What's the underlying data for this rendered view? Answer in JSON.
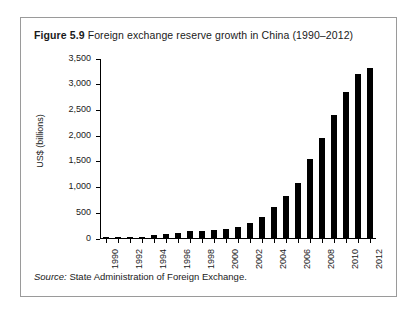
{
  "figure": {
    "label": "Figure 5.9",
    "title": "Foreign exchange reserve growth in China (1990–2012)",
    "source_label": "Source:",
    "source_text": "State Administration of Foreign Exchange."
  },
  "chart_data": {
    "type": "bar",
    "title": "Foreign exchange reserve growth in China (1990–2012)",
    "xlabel": "",
    "ylabel": "US$ (billions)",
    "ylim": [
      0,
      3500
    ],
    "ytick_labels": [
      "0",
      "500",
      "1,000",
      "1,500",
      "2,000",
      "2,500",
      "3,000",
      "3,500"
    ],
    "ytick_values": [
      0,
      500,
      1000,
      1500,
      2000,
      2500,
      3000,
      3500
    ],
    "grid": false,
    "legend": "none",
    "bar_color": "#000000",
    "categories": [
      "1990",
      "1991",
      "1992",
      "1993",
      "1994",
      "1995",
      "1996",
      "1997",
      "1998",
      "1999",
      "2000",
      "2001",
      "2002",
      "2003",
      "2004",
      "2005",
      "2006",
      "2007",
      "2008",
      "2009",
      "2010",
      "2011",
      "2012"
    ],
    "xtick_labels_shown": [
      "1990",
      "1992",
      "1994",
      "1996",
      "1998",
      "2000",
      "2002",
      "2004",
      "2006",
      "2008",
      "2010",
      "2012"
    ],
    "values": [
      11,
      22,
      19,
      21,
      52,
      74,
      107,
      140,
      145,
      155,
      166,
      212,
      286,
      403,
      610,
      819,
      1066,
      1528,
      1946,
      2399,
      2847,
      3181,
      3312
    ]
  }
}
